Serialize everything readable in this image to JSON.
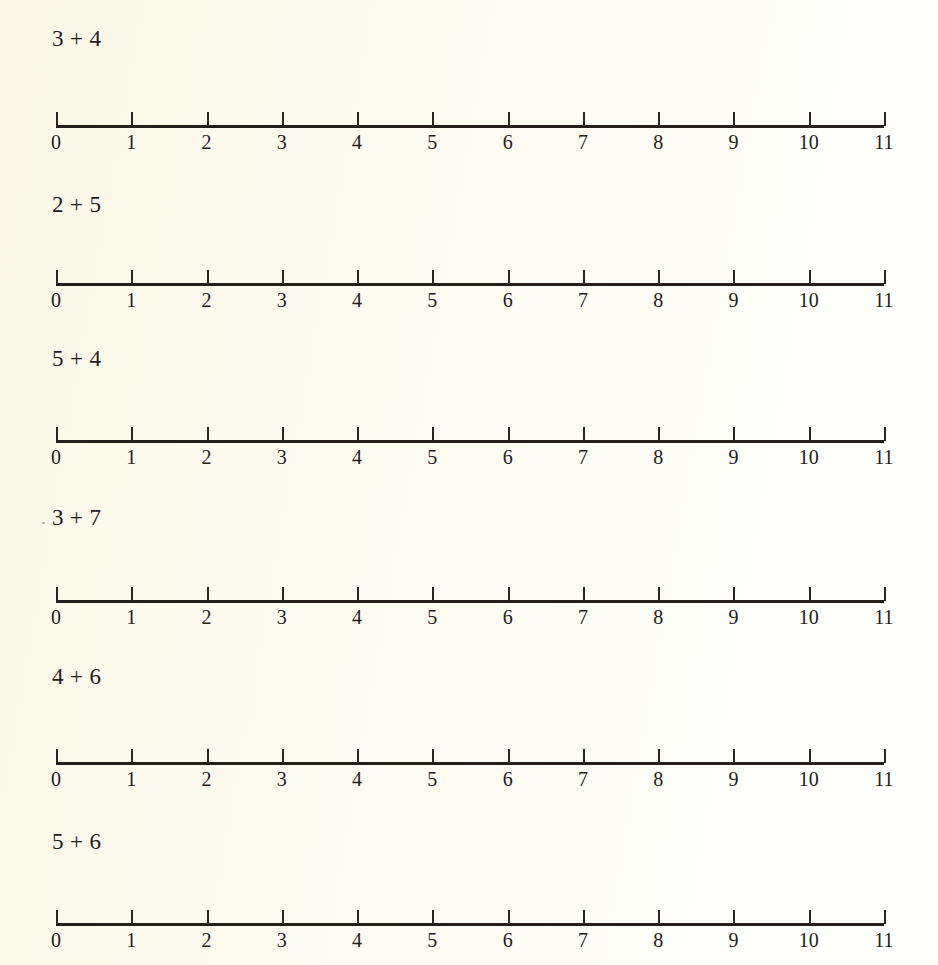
{
  "page": {
    "background_color": "#fcfbf0",
    "ink_color": "#23201c",
    "worksheet_kind": "addition-number-line-worksheet"
  },
  "number_line": {
    "min": 0,
    "max": 11,
    "tick_labels": [
      "0",
      "1",
      "2",
      "3",
      "4",
      "5",
      "6",
      "7",
      "8",
      "9",
      "10",
      "11"
    ],
    "tick_direction": "up",
    "axis_left_px": 56,
    "axis_right_px": 884,
    "tick_spacing_px": 75.3
  },
  "exercises": [
    {
      "index": 1,
      "addend_a": "3",
      "operator": "+",
      "addend_b": "4",
      "problem_text": "3 + 4",
      "problem_top_px": 26,
      "problem_left_px": 52,
      "line_top_px": 107
    },
    {
      "index": 2,
      "addend_a": "2",
      "operator": "+",
      "addend_b": "5",
      "problem_text": "2 + 5",
      "problem_top_px": 192,
      "problem_left_px": 52,
      "line_top_px": 265
    },
    {
      "index": 3,
      "addend_a": "5",
      "operator": "+",
      "addend_b": "4",
      "problem_text": "5 + 4",
      "problem_top_px": 346,
      "problem_left_px": 52,
      "line_top_px": 422
    },
    {
      "index": 4,
      "addend_a": "3",
      "operator": "+",
      "addend_b": "7",
      "problem_text": "3 + 7",
      "problem_top_px": 505,
      "problem_left_px": 52,
      "line_top_px": 582
    },
    {
      "index": 5,
      "addend_a": "4",
      "operator": "+",
      "addend_b": "6",
      "problem_text": "4 + 6",
      "problem_top_px": 664,
      "problem_left_px": 52,
      "line_top_px": 744
    },
    {
      "index": 6,
      "addend_a": "5",
      "operator": "+",
      "addend_b": "6",
      "problem_text": "5 + 6",
      "problem_top_px": 829,
      "problem_left_px": 52,
      "line_top_px": 905
    }
  ]
}
